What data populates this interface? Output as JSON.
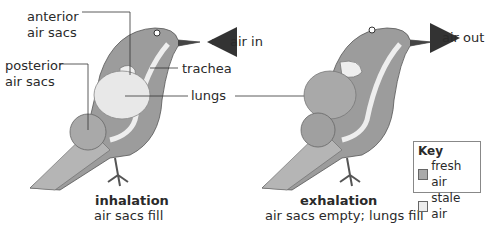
{
  "left_diagram": {
    "labels": {
      "anterior": "anterior",
      "anterior2": "air sacs",
      "posterior": "posterior",
      "posterior2": "air sacs",
      "trachea": "trachea",
      "lungs": "lungs",
      "air_in": "air in"
    },
    "caption_title": "inhalation",
    "caption_sub": "air sacs fill"
  },
  "right_diagram": {
    "labels": {
      "air_out": "air out"
    },
    "caption_title": "exhalation",
    "caption_sub": "air sacs empty; lungs fill"
  },
  "key": {
    "title": "Key",
    "items": [
      {
        "label": "fresh air",
        "color": "#a9a9a9"
      },
      {
        "label": "stale air",
        "color": "#ececec"
      }
    ]
  },
  "colors": {
    "bird_body": "#9c9c9c",
    "bird_light": "#bdbdbd",
    "fresh": "#a9a9a9",
    "stale": "#ececec",
    "arrow": "#333333"
  }
}
